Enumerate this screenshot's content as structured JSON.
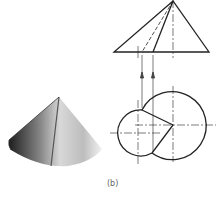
{
  "figure": {
    "caption": "(b)",
    "colors": {
      "line": "#222222",
      "shade_dark": "#2a2a2a",
      "shade_light": "#e6e6e6",
      "caption": "#666666"
    }
  }
}
